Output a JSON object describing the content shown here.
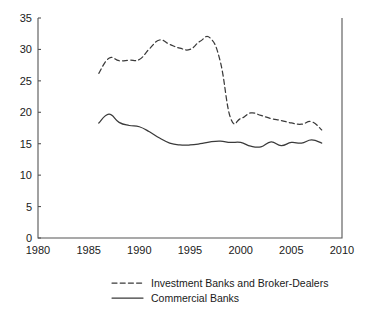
{
  "chart_data": {
    "type": "line",
    "title": "",
    "subtitle": "",
    "xlabel": "",
    "ylabel": "",
    "xlim": [
      1980,
      2010
    ],
    "ylim": [
      0,
      35
    ],
    "xticks": [
      1980,
      1985,
      1990,
      1995,
      2000,
      2005,
      2010
    ],
    "yticks": [
      0,
      5,
      10,
      15,
      20,
      25,
      30,
      35
    ],
    "xtick_labels": [
      "1980",
      "1985",
      "1990",
      "1995",
      "2000",
      "2005",
      "2010"
    ],
    "ytick_labels": [
      "0",
      "5",
      "10",
      "15",
      "20",
      "25",
      "30",
      "35"
    ],
    "grid": false,
    "legend_position": "below",
    "x": [
      1986,
      1987,
      1988,
      1989,
      1990,
      1991,
      1992,
      1993,
      1994,
      1995,
      1996,
      1997,
      1998,
      1999,
      2000,
      2001,
      2002,
      2003,
      2004,
      2005,
      2006,
      2007,
      2008
    ],
    "series": [
      {
        "name": "Investment Banks and Broker-Dealers",
        "style": "dashed",
        "color": "#3a3a3a",
        "values": [
          26.2,
          28.6,
          28.2,
          28.3,
          28.4,
          30.1,
          31.5,
          30.8,
          30.2,
          30.0,
          31.3,
          31.8,
          28.0,
          19.1,
          19.0,
          19.9,
          19.5,
          19.0,
          18.7,
          18.3,
          18.1,
          18.5,
          17.2
        ]
      },
      {
        "name": "Commercial Banks",
        "style": "solid",
        "color": "#3a3a3a",
        "values": [
          18.3,
          19.7,
          18.4,
          17.9,
          17.7,
          16.9,
          15.9,
          15.1,
          14.8,
          14.8,
          15.0,
          15.3,
          15.4,
          15.2,
          15.2,
          14.6,
          14.5,
          15.3,
          14.7,
          15.2,
          15.1,
          15.6,
          15.1
        ]
      }
    ],
    "legend": [
      {
        "label": "Investment Banks and Broker-Dealers",
        "style": "dashed"
      },
      {
        "label": "Commercial Banks",
        "style": "solid"
      }
    ]
  }
}
